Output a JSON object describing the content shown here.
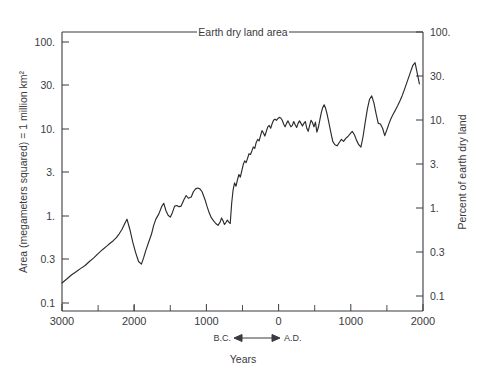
{
  "chart_data": {
    "type": "line",
    "title": "Earth dry land area",
    "xlabel": "Years",
    "ylabel": "Area (megameters squared) = 1 million km²",
    "ylabel_right": "Percent of earth dry land",
    "yscale": "log",
    "ylim": [
      0.1,
      100
    ],
    "xlim": [
      -3000,
      2000
    ],
    "grid": false,
    "legend": null,
    "era_annotation": {
      "left": "B.C.",
      "right": "A.D.",
      "arrow": "↔",
      "at_x": 0
    },
    "y_ticks_left": [
      "0.1",
      "0.3",
      "1.",
      "3.",
      "10.",
      "30.",
      "100."
    ],
    "y_tick_values_left": [
      0.1,
      0.3,
      1,
      3,
      10,
      30,
      100
    ],
    "y_ticks_right": [
      "0.1",
      "0.3",
      "1.",
      "3.",
      "10.",
      "30.",
      "100."
    ],
    "y_tick_values_right": [
      0.1,
      0.3,
      1,
      3,
      10,
      30,
      100
    ],
    "x_ticks": [
      "3000",
      "2000",
      "1000",
      "0",
      "1000",
      "2000"
    ],
    "x_tick_values": [
      -3000,
      -2000,
      -1000,
      0,
      1000,
      2000
    ],
    "x_minor_tick_values": [
      -2500,
      -1500,
      -500,
      500,
      1500
    ],
    "series": [
      {
        "name": "Earth dry land area",
        "x": [
          -3000,
          -2930,
          -2870,
          -2800,
          -2740,
          -2680,
          -2620,
          -2560,
          -2500,
          -2440,
          -2380,
          -2330,
          -2290,
          -2250,
          -2210,
          -2170,
          -2130,
          -2100,
          -2060,
          -2020,
          -1980,
          -1940,
          -1900,
          -1870,
          -1840,
          -1800,
          -1760,
          -1730,
          -1700,
          -1660,
          -1620,
          -1590,
          -1560,
          -1530,
          -1500,
          -1470,
          -1440,
          -1410,
          -1380,
          -1350,
          -1310,
          -1280,
          -1250,
          -1210,
          -1180,
          -1150,
          -1120,
          -1090,
          -1060,
          -1020,
          -990,
          -960,
          -930,
          -900,
          -870,
          -840,
          -810,
          -790,
          -770,
          -750,
          -730,
          -710,
          -690,
          -670,
          -650,
          -630,
          -610,
          -590,
          -570,
          -550,
          -530,
          -510,
          -490,
          -470,
          -450,
          -430,
          -410,
          -390,
          -370,
          -350,
          -330,
          -310,
          -290,
          -270,
          -250,
          -230,
          -210,
          -190,
          -170,
          -150,
          -130,
          -110,
          -90,
          -70,
          -50,
          -30,
          -10,
          10,
          30,
          50,
          70,
          90,
          110,
          130,
          150,
          170,
          190,
          210,
          230,
          250,
          270,
          290,
          310,
          330,
          350,
          370,
          390,
          410,
          430,
          450,
          470,
          490,
          510,
          530,
          550,
          570,
          590,
          610,
          630,
          650,
          670,
          690,
          710,
          730,
          750,
          780,
          810,
          840,
          870,
          900,
          930,
          960,
          990,
          1020,
          1050,
          1080,
          1110,
          1140,
          1170,
          1200,
          1230,
          1260,
          1290,
          1320,
          1350,
          1380,
          1410,
          1440,
          1470,
          1500,
          1530,
          1560,
          1590,
          1620,
          1650,
          1680,
          1710,
          1740,
          1770,
          1800,
          1830,
          1860,
          1890,
          1920,
          1950
        ],
        "y": [
          0.17,
          0.19,
          0.21,
          0.23,
          0.25,
          0.27,
          0.3,
          0.33,
          0.37,
          0.41,
          0.45,
          0.49,
          0.52,
          0.56,
          0.62,
          0.7,
          0.82,
          0.92,
          0.7,
          0.5,
          0.38,
          0.3,
          0.28,
          0.33,
          0.4,
          0.5,
          0.62,
          0.78,
          0.92,
          1.05,
          1.28,
          1.4,
          1.15,
          1.02,
          0.97,
          1.1,
          1.3,
          1.32,
          1.28,
          1.3,
          1.55,
          1.72,
          1.6,
          1.65,
          1.9,
          2.05,
          2.1,
          2.05,
          1.9,
          1.55,
          1.28,
          1.08,
          0.95,
          0.88,
          0.82,
          0.78,
          0.85,
          0.95,
          0.88,
          0.8,
          0.84,
          0.9,
          0.85,
          0.82,
          1.4,
          2.0,
          2.4,
          2.2,
          2.6,
          3.0,
          2.8,
          3.3,
          3.9,
          4.3,
          4.1,
          4.6,
          5.2,
          5.1,
          5.6,
          6.2,
          6.0,
          7.0,
          7.6,
          7.3,
          8.4,
          9.6,
          9.0,
          8.3,
          9.4,
          10.6,
          11.0,
          10.2,
          11.5,
          12.6,
          13.0,
          12.6,
          13.2,
          13.6,
          13.4,
          12.6,
          11.4,
          10.6,
          11.6,
          12.4,
          11.4,
          10.6,
          11.0,
          12.2,
          11.2,
          10.4,
          11.6,
          12.4,
          11.6,
          10.8,
          11.6,
          12.2,
          10.2,
          9.4,
          11.0,
          12.6,
          11.8,
          10.6,
          12.0,
          9.2,
          10.4,
          12.6,
          15.2,
          17.6,
          19.0,
          17.4,
          15.0,
          12.6,
          10.4,
          8.6,
          7.2,
          6.6,
          6.4,
          7.0,
          7.6,
          7.2,
          7.8,
          8.2,
          8.8,
          9.4,
          8.6,
          7.4,
          6.6,
          6.2,
          8.2,
          12.0,
          17.0,
          22.0,
          24.0,
          20.0,
          15.0,
          11.6,
          11.4,
          10.2,
          8.4,
          9.8,
          11.6,
          13.4,
          15.0,
          16.6,
          18.6,
          21.0,
          24.0,
          28.0,
          33.0,
          39.0,
          46.0,
          54.0,
          58.0,
          44.0,
          33.0
        ]
      }
    ]
  }
}
